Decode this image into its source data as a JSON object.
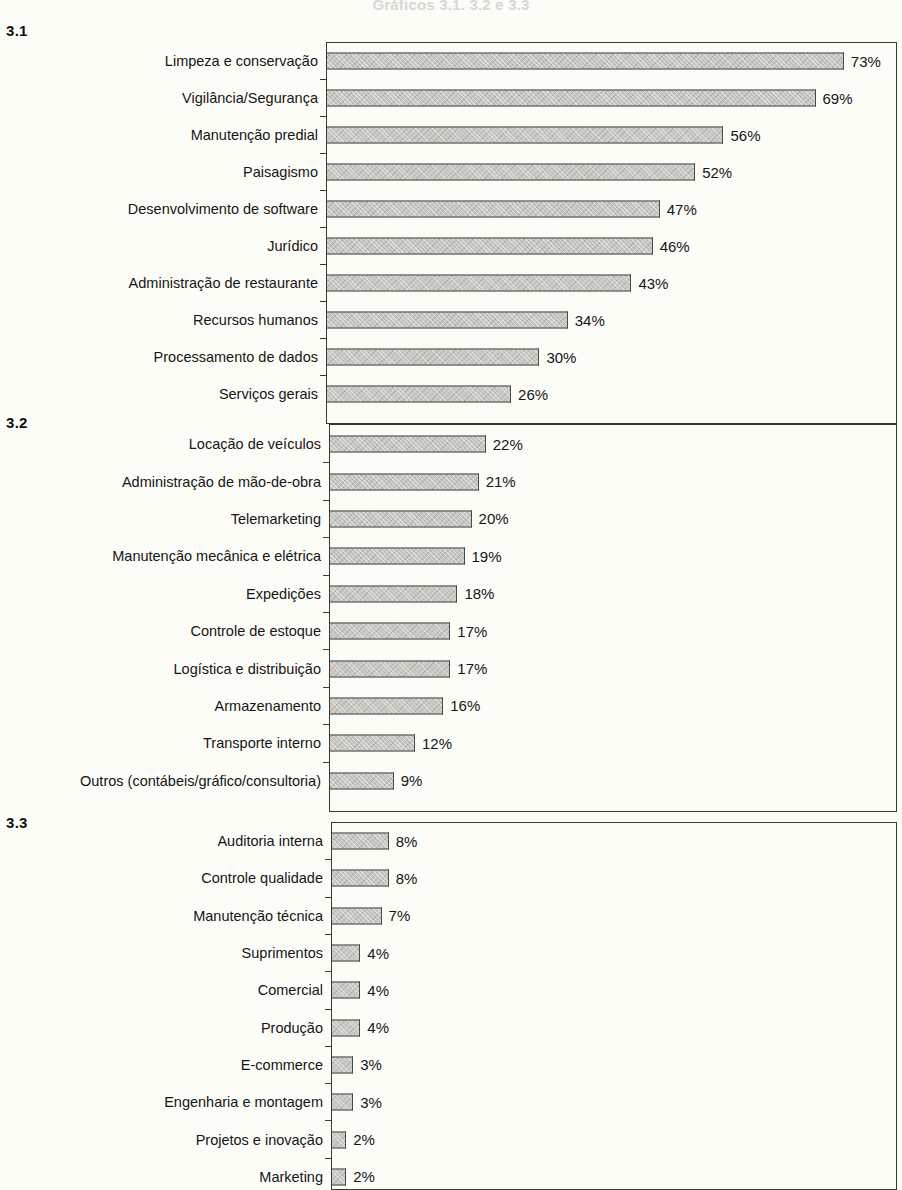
{
  "document": {
    "title_faded": "Gráficos 3.1, 3.2 e 3.3"
  },
  "panels": [
    {
      "tag": "3.1"
    },
    {
      "tag": "3.2"
    },
    {
      "tag": "3.3"
    }
  ],
  "chart_data": [
    {
      "type": "bar",
      "title": "3.1",
      "orientation": "horizontal",
      "xlabel": "",
      "ylabel": "",
      "xlim": [
        0,
        78
      ],
      "grid": false,
      "legend": "none",
      "value_suffix": "%",
      "categories": [
        "Limpeza e conservação",
        "Vigilância/Segurança",
        "Manutenção predial",
        "Paisagismo",
        "Desenvolvimento de software",
        "Jurídico",
        "Administração de restaurante",
        "Recursos humanos",
        "Processamento de dados",
        "Serviços gerais"
      ],
      "values": [
        73,
        69,
        56,
        52,
        47,
        46,
        43,
        34,
        30,
        26
      ],
      "labels": [
        "73%",
        "69%",
        "56%",
        "52%",
        "47%",
        "46%",
        "43%",
        "34%",
        "30%",
        "26%"
      ]
    },
    {
      "type": "bar",
      "title": "3.2",
      "orientation": "horizontal",
      "xlabel": "",
      "ylabel": "",
      "xlim": [
        0,
        78
      ],
      "grid": false,
      "legend": "none",
      "value_suffix": "%",
      "categories": [
        "Locação de veículos",
        "Administração de mão-de-obra",
        "Telemarketing",
        "Manutenção mecânica e elétrica",
        "Expedições",
        "Controle de estoque",
        "Logística e distribuição",
        "Armazenamento",
        "Transporte interno",
        "Outros (contábeis/gráfico/consultoria)"
      ],
      "values": [
        22,
        21,
        20,
        19,
        18,
        17,
        17,
        16,
        12,
        9
      ],
      "labels": [
        "22%",
        "21%",
        "20%",
        "19%",
        "18%",
        "17%",
        "17%",
        "16%",
        "12%",
        "9%"
      ]
    },
    {
      "type": "bar",
      "title": "3.3",
      "orientation": "horizontal",
      "xlabel": "",
      "ylabel": "",
      "xlim": [
        0,
        78
      ],
      "grid": false,
      "legend": "none",
      "value_suffix": "%",
      "categories": [
        "Auditoria interna",
        "Controle qualidade",
        "Manutenção técnica",
        "Suprimentos",
        "Comercial",
        "Produção",
        "E-commerce",
        "Engenharia e montagem",
        "Projetos e inovação",
        "Marketing"
      ],
      "values": [
        8,
        8,
        7,
        4,
        4,
        4,
        3,
        3,
        2,
        2
      ],
      "labels": [
        "8%",
        "8%",
        "7%",
        "4%",
        "4%",
        "4%",
        "3%",
        "3%",
        "2%",
        "2%"
      ]
    }
  ],
  "style": {
    "bar_fill": "#c6c6c0",
    "bar_stroke": "#4a4a44",
    "frame_stroke": "#3a3a33",
    "background": "#fdfdf8",
    "text": "#151515"
  }
}
